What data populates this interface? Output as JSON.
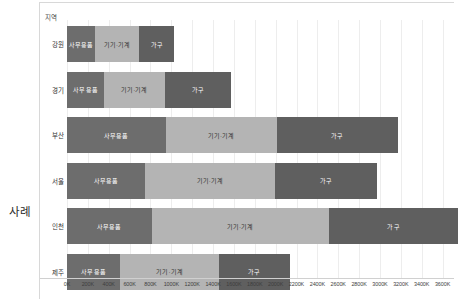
{
  "chart_data": {
    "type": "bar",
    "orientation": "horizontal",
    "stacked": true,
    "title": "",
    "subtitle": "",
    "xlabel": "",
    "ylabel": "사례",
    "row_field_label": "사례",
    "row_dimension_header": "지역",
    "categories": [
      "강원",
      "경기",
      "부산",
      "서울",
      "인천",
      "제주"
    ],
    "series": [
      {
        "name": "사무용품",
        "color": "#6d6d6d",
        "values": [
          270000,
          355000,
          945000,
          750000,
          810000,
          510000
        ]
      },
      {
        "name": "기기·기계",
        "color": "#b4b4b4",
        "values": [
          420000,
          580000,
          1065000,
          1240000,
          1700000,
          945000
        ]
      },
      {
        "name": "가구",
        "color": "#5f5f5f",
        "values": [
          340000,
          635000,
          1165000,
          980000,
          1240000,
          680000
        ]
      }
    ],
    "totals": [
      1030000,
      1570000,
      3175000,
      2970000,
      3750000,
      2135000
    ],
    "xlim": [
      0,
      3700000
    ],
    "xtick_values": [
      0,
      200000,
      400000,
      600000,
      800000,
      1000000,
      1200000,
      1400000,
      1600000,
      1800000,
      2000000,
      2200000,
      2400000,
      2600000,
      2800000,
      3000000,
      3200000,
      3400000,
      3600000
    ],
    "xtick_labels": [
      "0K",
      "200K",
      "400K",
      "600K",
      "800K",
      "1000K",
      "1200K",
      "1400K",
      "1600K",
      "1800K",
      "2000K",
      "2200K",
      "2400K",
      "2600K",
      "2800K",
      "3000K",
      "3200K",
      "3400K",
      "3600K"
    ],
    "grid": true,
    "grid_axis": "x",
    "legend": false,
    "legend_position": "none",
    "value_labels_inside_bars": true,
    "background_color": "#ffffff",
    "gridline_color": "#ededed"
  }
}
